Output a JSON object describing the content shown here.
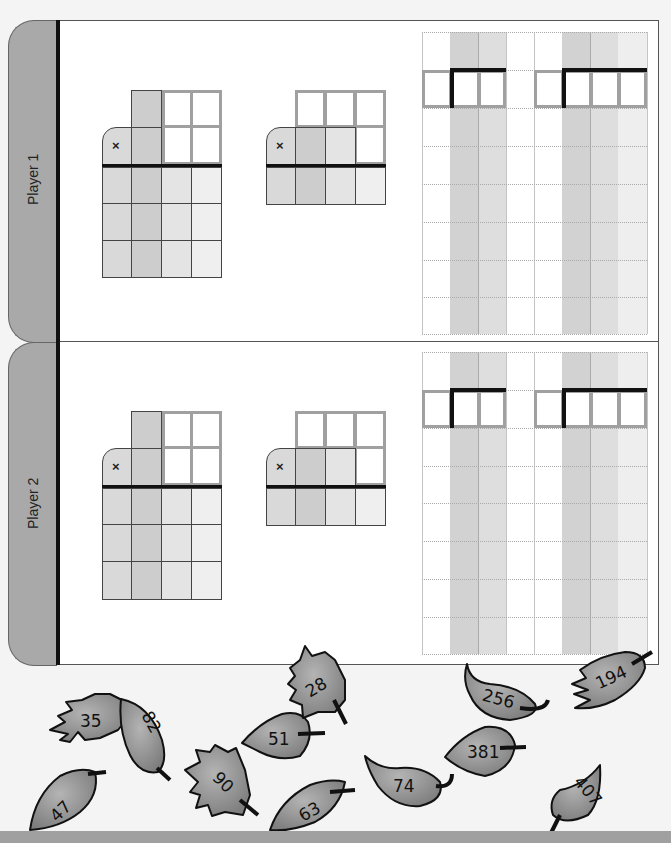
{
  "players": [
    {
      "label": "Player 1"
    },
    {
      "label": "Player 2"
    }
  ],
  "multiplication": {
    "operator_symbol": "×"
  },
  "colors": {
    "background": "#f4f4f4",
    "tab": "#a9a9a9",
    "leaf": "#9a9a9a",
    "bottom_bar": "#a0a0a0"
  },
  "leaves": [
    {
      "value": "35"
    },
    {
      "value": "82"
    },
    {
      "value": "47"
    },
    {
      "value": "90"
    },
    {
      "value": "51"
    },
    {
      "value": "28"
    },
    {
      "value": "63"
    },
    {
      "value": "74"
    },
    {
      "value": "381"
    },
    {
      "value": "256"
    },
    {
      "value": "194"
    },
    {
      "value": "407"
    }
  ]
}
